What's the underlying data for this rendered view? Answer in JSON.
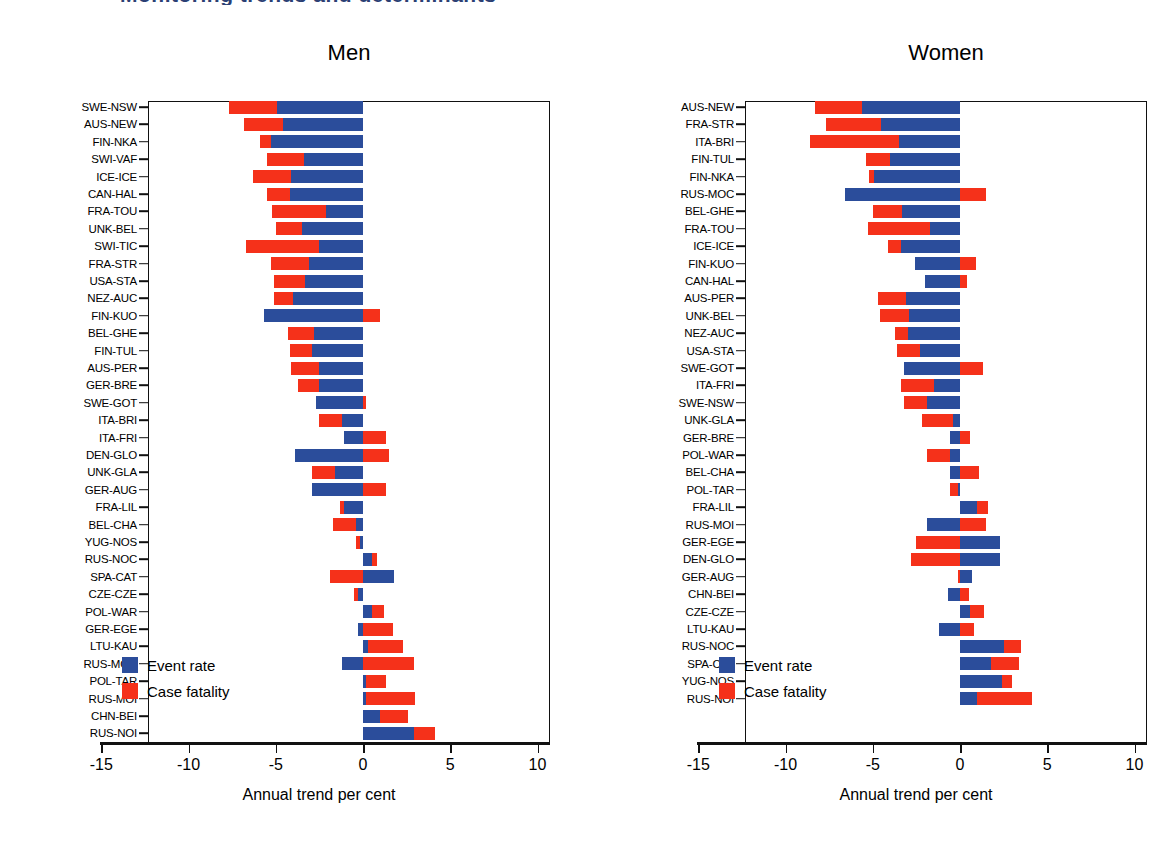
{
  "figure": {
    "clipped_header": "Monitoring trends and determinants",
    "axis_title": "Annual trend per cent",
    "legend": {
      "event_label": "Event rate",
      "fatality_label": "Case fatality"
    },
    "colors": {
      "event_rate": "#2b4d9b",
      "case_fatality": "#f5311a",
      "axis": "#111111",
      "header_text": "#2b3f74"
    },
    "x_ticks": [
      "-15",
      "-10",
      "-5",
      "0",
      "5",
      "10"
    ]
  },
  "chart_data": {
    "type": "bar",
    "orientation": "horizontal",
    "stacked": true,
    "title": "",
    "xlabel": "Annual trend per cent",
    "ylabel": "",
    "xlim": [
      -15,
      10
    ],
    "xticks": [
      -15,
      -10,
      -5,
      0,
      5,
      10
    ],
    "grid": false,
    "legend_position": "inside-lower-left",
    "series": [
      {
        "name": "Event rate",
        "color": "#2b4d9b"
      },
      {
        "name": "Case fatality",
        "color": "#f5311a"
      }
    ],
    "panels": [
      {
        "title": "Men",
        "categories": [
          "SWE-NSW",
          "AUS-NEW",
          "FIN-NKA",
          "SWI-VAF",
          "ICE-ICE",
          "CAN-HAL",
          "FRA-TOU",
          "UNK-BEL",
          "SWI-TIC",
          "FRA-STR",
          "USA-STA",
          "NEZ-AUC",
          "FIN-KUO",
          "BEL-GHE",
          "FIN-TUL",
          "AUS-PER",
          "GER-BRE",
          "SWE-GOT",
          "ITA-BRI",
          "ITA-FRI",
          "DEN-GLO",
          "UNK-GLA",
          "GER-AUG",
          "FRA-LIL",
          "BEL-CHA",
          "YUG-NOS",
          "RUS-NOC",
          "SPA-CAT",
          "CZE-CZE",
          "POL-WAR",
          "GER-EGE",
          "LTU-KAU",
          "RUS-MOC",
          "POL-TAR",
          "RUS-MOI",
          "CHN-BEI",
          "RUS-NOI"
        ],
        "event_rate": [
          -4.9,
          -4.6,
          -5.3,
          -3.4,
          -4.1,
          -4.2,
          -2.1,
          -3.5,
          -2.5,
          -3.1,
          -3.3,
          -4.0,
          -5.7,
          -2.8,
          -2.9,
          -2.5,
          -2.5,
          -2.7,
          -1.2,
          -1.1,
          -3.9,
          -1.6,
          -2.9,
          -1.1,
          -0.4,
          -0.2,
          0.5,
          1.8,
          -0.3,
          0.5,
          -0.3,
          0.3,
          -1.2,
          0.2,
          0.2,
          1.0,
          2.9
        ],
        "case_fatality": [
          -2.8,
          -2.2,
          -0.6,
          -2.1,
          -2.2,
          -1.3,
          -3.1,
          -1.5,
          -4.2,
          -2.2,
          -1.8,
          -1.1,
          1.0,
          -1.5,
          -1.3,
          -1.6,
          -1.2,
          0.2,
          -1.3,
          1.3,
          1.5,
          -1.3,
          1.3,
          -0.2,
          -1.3,
          -0.2,
          0.3,
          -1.9,
          -0.2,
          0.7,
          1.7,
          2.0,
          2.9,
          1.1,
          2.8,
          1.6,
          1.2
        ]
      },
      {
        "title": "Women",
        "categories": [
          "AUS-NEW",
          "FRA-STR",
          "ITA-BRI",
          "FIN-TUL",
          "FIN-NKA",
          "RUS-MOC",
          "BEL-GHE",
          "FRA-TOU",
          "ICE-ICE",
          "FIN-KUO",
          "CAN-HAL",
          "AUS-PER",
          "UNK-BEL",
          "NEZ-AUC",
          "USA-STA",
          "SWE-GOT",
          "ITA-FRI",
          "SWE-NSW",
          "UNK-GLA",
          "GER-BRE",
          "POL-WAR",
          "BEL-CHA",
          "POL-TAR",
          "FRA-LIL",
          "RUS-MOI",
          "GER-EGE",
          "DEN-GLO",
          "GER-AUG",
          "CHN-BEI",
          "CZE-CZE",
          "LTU-KAU",
          "RUS-NOC",
          "SPA-CAT",
          "YUG-NOS",
          "RUS-NOI"
        ],
        "event_rate": [
          -5.6,
          -4.5,
          -3.5,
          -4.0,
          -4.9,
          -6.6,
          -3.3,
          -1.7,
          -3.4,
          -2.6,
          -2.0,
          -3.1,
          -2.9,
          -3.0,
          -2.3,
          -3.2,
          -1.5,
          -1.9,
          -0.4,
          -0.6,
          -0.6,
          -0.6,
          -0.1,
          1.0,
          -1.9,
          2.3,
          2.3,
          0.7,
          -0.7,
          0.6,
          -1.2,
          2.5,
          1.8,
          2.4,
          1.0
        ],
        "case_fatality": [
          -2.7,
          -3.2,
          -5.1,
          -1.4,
          -0.3,
          1.5,
          -1.7,
          -3.6,
          -0.7,
          0.9,
          0.4,
          -1.6,
          -1.7,
          -0.7,
          -1.3,
          1.3,
          -1.9,
          -1.3,
          -1.8,
          0.6,
          -1.3,
          1.1,
          -0.5,
          0.6,
          1.5,
          -2.5,
          -2.8,
          -0.1,
          0.5,
          0.8,
          0.8,
          1.0,
          1.6,
          0.6,
          3.1
        ]
      }
    ]
  }
}
